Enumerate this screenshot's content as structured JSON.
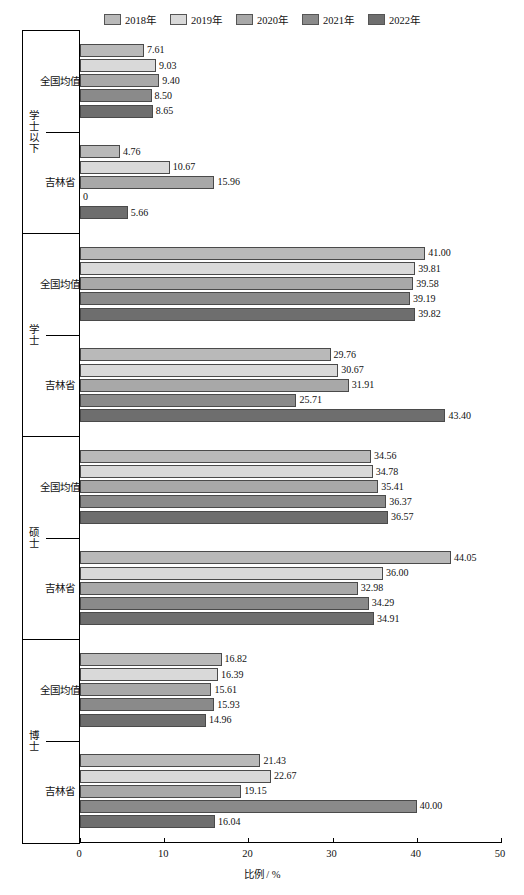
{
  "chart_data": {
    "type": "bar",
    "orientation": "horizontal",
    "title": "",
    "xlabel": "比例 / %",
    "ylabel": "",
    "xlim": [
      0,
      50
    ],
    "xticks": [
      0,
      10,
      20,
      30,
      40,
      50
    ],
    "grid": false,
    "legend_position": "top-center",
    "series": [
      {
        "name": "2018年",
        "color": "#b9b9b9"
      },
      {
        "name": "2019年",
        "color": "#d9d9d9"
      },
      {
        "name": "2020年",
        "color": "#a8a8a8"
      },
      {
        "name": "2021年",
        "color": "#8a8a8a"
      },
      {
        "name": "2022年",
        "color": "#6e6e6e"
      }
    ],
    "groups": [
      {
        "label": "学士以下",
        "categories": [
          {
            "name": "全国均值",
            "values": [
              7.61,
              9.03,
              9.4,
              8.5,
              8.65
            ]
          },
          {
            "name": "吉林省",
            "values": [
              4.76,
              10.67,
              15.96,
              0,
              5.66
            ]
          }
        ]
      },
      {
        "label": "学士",
        "categories": [
          {
            "name": "全国均值",
            "values": [
              41.0,
              39.81,
              39.58,
              39.19,
              39.82
            ]
          },
          {
            "name": "吉林省",
            "values": [
              29.76,
              30.67,
              31.91,
              25.71,
              43.4
            ]
          }
        ]
      },
      {
        "label": "硕士",
        "categories": [
          {
            "name": "全国均值",
            "values": [
              34.56,
              34.78,
              35.41,
              36.37,
              36.57
            ]
          },
          {
            "name": "吉林省",
            "values": [
              44.05,
              36.0,
              32.98,
              34.29,
              34.91
            ]
          }
        ]
      },
      {
        "label": "博士",
        "categories": [
          {
            "name": "全国均值",
            "values": [
              16.82,
              16.39,
              15.61,
              15.93,
              14.96
            ]
          },
          {
            "name": "吉林省",
            "values": [
              21.43,
              22.67,
              19.15,
              40.0,
              16.04
            ]
          }
        ]
      }
    ]
  }
}
